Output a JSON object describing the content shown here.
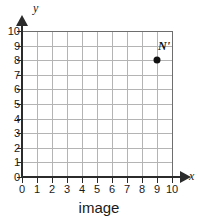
{
  "chart_data": {
    "type": "scatter",
    "title": "",
    "caption": "image",
    "xlabel": "x",
    "ylabel": "y",
    "xlim": [
      0,
      10
    ],
    "ylim": [
      0,
      10
    ],
    "xticks": [
      "0",
      "1",
      "2",
      "3",
      "4",
      "5",
      "6",
      "7",
      "8",
      "9",
      "10"
    ],
    "yticks": [
      "0",
      "1",
      "2",
      "3",
      "4",
      "5",
      "6",
      "7",
      "8",
      "9",
      "10"
    ],
    "grid": true,
    "grid_step": 1,
    "legend": null,
    "points": [
      {
        "label": "N'",
        "x": 9,
        "y": 8
      }
    ]
  },
  "colors": {
    "axis": "#2b2b2b",
    "grid": "#b4b4b4",
    "grid_border": "#6e6e6e",
    "point": "#111111",
    "text": "#1a1a1a",
    "background": "#ffffff"
  }
}
